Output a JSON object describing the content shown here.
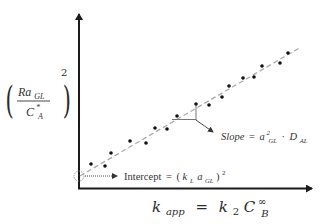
{
  "diagram": {
    "type": "linear-regression-plot",
    "y_axis_label": {
      "numerator_base": "Ra",
      "numerator_sub": "GL",
      "denominator_base": "C",
      "denominator_sub": "A",
      "denominator_sup": "*",
      "exponent": "2"
    },
    "x_axis_label": {
      "lhs_base": "k",
      "lhs_sub": "app",
      "equals": "=",
      "rhs_coef": "k",
      "rhs_coef_sub": "2",
      "rhs_base": "C",
      "rhs_sub": "B",
      "rhs_sup": "∞"
    },
    "slope_annotation": {
      "label": "Slope",
      "equals": "=",
      "term1_base": "a",
      "term1_sup": "2",
      "term1_sub": "GL",
      "dot": "·",
      "term2_base": "D",
      "term2_sub": "AL"
    },
    "intercept_annotation": {
      "label": "Intercept",
      "equals": "=",
      "open": "(",
      "k_base": "k",
      "k_sub": "L",
      "a_base": "a",
      "a_sub": "GL",
      "close": ")",
      "exponent": "2"
    },
    "colors": {
      "axis": "#1a1a1a",
      "points": "#111111",
      "fit_line": "#aaaaaa",
      "annotation": "#555555"
    }
  },
  "chart_data": {
    "type": "scatter",
    "title": "",
    "xlabel": "k_app = k2 C_B^∞",
    "ylabel": "(Ra_GL / C*_A)^2",
    "grid": false,
    "legend": null,
    "trendline": {
      "style": "dashed",
      "from_px": [
        80,
        176
      ],
      "to_px": [
        301,
        47
      ]
    },
    "points_px": [
      [
        91,
        164
      ],
      [
        105,
        166
      ],
      [
        111,
        153
      ],
      [
        130,
        141
      ],
      [
        146,
        143
      ],
      [
        155,
        128
      ],
      [
        167,
        129
      ],
      [
        177,
        116
      ],
      [
        196,
        104
      ],
      [
        209,
        105
      ],
      [
        222,
        97
      ],
      [
        229,
        86
      ],
      [
        243,
        78
      ],
      [
        254,
        77
      ],
      [
        262,
        66
      ],
      [
        280,
        63
      ],
      [
        288,
        53
      ]
    ],
    "annotations": [
      "Slope = a_GL^2 · D_AL",
      "Intercept = (k_L a_GL)^2"
    ]
  }
}
